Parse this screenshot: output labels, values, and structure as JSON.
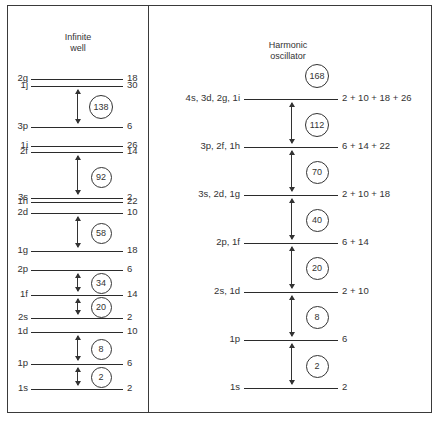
{
  "infinite_well": {
    "title_line1": "Infinite",
    "title_line2": "well",
    "levels": [
      {
        "label": "2g",
        "degeneracy": "18",
        "y": 79
      },
      {
        "label": "1j",
        "degeneracy": "30",
        "y": 86
      },
      {
        "label": "3p",
        "degeneracy": "6",
        "y": 127
      },
      {
        "label": "1i",
        "degeneracy": "26",
        "y": 146
      },
      {
        "label": "2f",
        "degeneracy": "14",
        "y": 152
      },
      {
        "label": "3s",
        "degeneracy": "2",
        "y": 198
      },
      {
        "label": "1h",
        "degeneracy": "22",
        "y": 202
      },
      {
        "label": "2d",
        "degeneracy": "10",
        "y": 213
      },
      {
        "label": "1g",
        "degeneracy": "18",
        "y": 251
      },
      {
        "label": "2p",
        "degeneracy": "6",
        "y": 270
      },
      {
        "label": "1f",
        "degeneracy": "14",
        "y": 295
      },
      {
        "label": "2s",
        "degeneracy": "2",
        "y": 318
      },
      {
        "label": "1d",
        "degeneracy": "10",
        "y": 332
      },
      {
        "label": "1p",
        "degeneracy": "6",
        "y": 364
      },
      {
        "label": "1s",
        "degeneracy": "2",
        "y": 389
      }
    ],
    "magic_numbers": [
      {
        "value": "138",
        "y": 106
      },
      {
        "value": "92",
        "y": 176
      },
      {
        "value": "58",
        "y": 232
      },
      {
        "value": "34",
        "y": 282
      },
      {
        "value": "20",
        "y": 306
      },
      {
        "value": "8",
        "y": 348
      },
      {
        "value": "2",
        "y": 376
      }
    ]
  },
  "harmonic_oscillator": {
    "title_line1": "Harmonic",
    "title_line2": "oscillator",
    "top_magic_number": "168",
    "levels": [
      {
        "label": "4s, 3d, 2g, 1i",
        "degeneracy": "2 + 10 + 18 + 26",
        "y": 99
      },
      {
        "label": "3p, 2f, 1h",
        "degeneracy": "6 + 14 + 22",
        "y": 147
      },
      {
        "label": "3s, 2d, 1g",
        "degeneracy": "2 + 10 + 18",
        "y": 195
      },
      {
        "label": "2p, 1f",
        "degeneracy": "6 + 14",
        "y": 243
      },
      {
        "label": "2s, 1d",
        "degeneracy": "2 + 10",
        "y": 292
      },
      {
        "label": "1p",
        "degeneracy": "6",
        "y": 340
      },
      {
        "label": "1s",
        "degeneracy": "2",
        "y": 388
      }
    ],
    "magic_numbers": [
      {
        "value": "112",
        "y": 124
      },
      {
        "value": "70",
        "y": 171
      },
      {
        "value": "40",
        "y": 219
      },
      {
        "value": "20",
        "y": 267
      },
      {
        "value": "8",
        "y": 316
      },
      {
        "value": "2",
        "y": 365
      }
    ]
  }
}
